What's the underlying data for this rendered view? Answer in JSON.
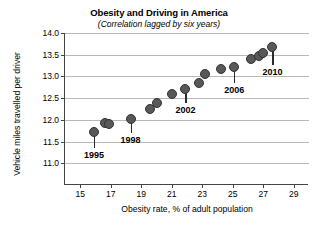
{
  "chart_data": {
    "type": "scatter",
    "title": "Obesity and Driving in America",
    "subtitle": "(Correlation lagged by six years)",
    "xlabel": "Obesity rate, % of adult population",
    "ylabel": "Vehicle miles travelled per driver",
    "xlim": [
      14,
      30
    ],
    "ylim": [
      10.5,
      14.0
    ],
    "xticks": [
      15,
      17,
      19,
      21,
      23,
      25,
      27,
      29
    ],
    "yticks": [
      "11.0",
      "11.5",
      "12.0",
      "12.5",
      "13.0",
      "13.5",
      "14.0"
    ],
    "ytick_values": [
      11.0,
      11.5,
      12.0,
      12.5,
      13.0,
      13.5,
      14.0
    ],
    "grid": "horizontal",
    "legend": "none",
    "marker_color": "#585858",
    "marker_edge_color": "#333333",
    "grid_color": "#b9b9b9",
    "axis_color": "#444444",
    "points": [
      {
        "year": "1995",
        "x": 15.9,
        "y": 11.72,
        "label": true
      },
      {
        "year": "1996",
        "x": 16.6,
        "y": 11.92,
        "label": false
      },
      {
        "year": "1997",
        "x": 16.9,
        "y": 11.9,
        "label": false
      },
      {
        "year": "1998",
        "x": 18.3,
        "y": 12.02,
        "label": true
      },
      {
        "year": "1999",
        "x": 19.6,
        "y": 12.26,
        "label": false
      },
      {
        "year": "2000",
        "x": 20.0,
        "y": 12.38,
        "label": false
      },
      {
        "year": "2001",
        "x": 21.0,
        "y": 12.6,
        "label": false
      },
      {
        "year": "2002",
        "x": 21.9,
        "y": 12.72,
        "label": true
      },
      {
        "year": "2003",
        "x": 22.8,
        "y": 12.86,
        "label": false
      },
      {
        "year": "2004",
        "x": 23.2,
        "y": 13.05,
        "label": false
      },
      {
        "year": "2005",
        "x": 24.2,
        "y": 13.17,
        "label": false
      },
      {
        "year": "2006",
        "x": 25.1,
        "y": 13.22,
        "label": true
      },
      {
        "year": "2007",
        "x": 26.2,
        "y": 13.4,
        "label": false
      },
      {
        "year": "2008",
        "x": 26.7,
        "y": 13.48,
        "label": false
      },
      {
        "year": "2009",
        "x": 27.0,
        "y": 13.55,
        "label": false
      },
      {
        "year": "2010",
        "x": 27.6,
        "y": 13.68,
        "label": true
      }
    ],
    "year_labels": [
      {
        "year": "1995",
        "x": 15.9,
        "y": 11.72,
        "label_y": 11.28
      },
      {
        "year": "1998",
        "x": 18.3,
        "y": 12.02,
        "label_y": 11.62
      },
      {
        "year": "2002",
        "x": 21.9,
        "y": 12.72,
        "label_y": 12.31
      },
      {
        "year": "2006",
        "x": 25.1,
        "y": 13.22,
        "label_y": 12.79
      },
      {
        "year": "2010",
        "x": 27.6,
        "y": 13.68,
        "label_y": 13.19
      }
    ]
  }
}
